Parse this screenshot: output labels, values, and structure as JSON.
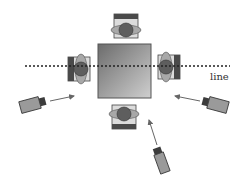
{
  "diagram": {
    "line_label": "line",
    "table": {
      "label": "table",
      "color_top": "#6f6f6f",
      "color_bottom": "#c9c9c9"
    },
    "people": [
      {
        "id": "top",
        "position": "top"
      },
      {
        "id": "left",
        "position": "left"
      },
      {
        "id": "right",
        "position": "right"
      },
      {
        "id": "bottom",
        "position": "bottom"
      }
    ],
    "cameras": [
      {
        "id": "left",
        "position": "left"
      },
      {
        "id": "right",
        "position": "right"
      },
      {
        "id": "bottom-right",
        "position": "bottom-right"
      }
    ],
    "colors": {
      "head": "#5e5e5e",
      "shoulders": "#a8a8a8",
      "chair_dark": "#4a4a4a",
      "chair_light": "#d8d8d8",
      "camera_body": "#9a9a9a",
      "camera_lens": "#3c3c3c",
      "arrow": "#666666",
      "dotted_line": "#222222"
    }
  }
}
